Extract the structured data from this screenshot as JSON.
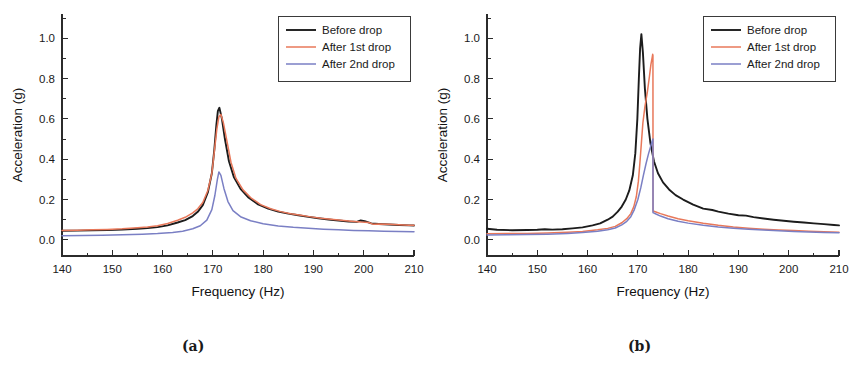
{
  "figure": {
    "panels": [
      {
        "id": "a",
        "caption": "(a)"
      },
      {
        "id": "b",
        "caption": "(b)"
      }
    ]
  },
  "colors": {
    "before_drop": "#1c1c1c",
    "after_1st_drop": "#e8785a",
    "after_2nd_drop": "#7a7fc4",
    "axis": "#2b2b2b",
    "background": "#ffffff"
  },
  "chart_data": [
    {
      "type": "line",
      "panel": "a",
      "title": "",
      "xlabel": "Frequency (Hz)",
      "ylabel": "Acceleration (g)",
      "xlim": [
        140,
        210
      ],
      "ylim": [
        -0.08,
        1.12
      ],
      "xticks": [
        140,
        150,
        160,
        170,
        180,
        190,
        200,
        210
      ],
      "yticks": [
        0.0,
        0.2,
        0.4,
        0.6,
        0.8,
        1.0
      ],
      "xtick_labels": [
        "140",
        "150",
        "160",
        "170",
        "180",
        "190",
        "200",
        "210"
      ],
      "ytick_labels": [
        "0.0",
        "0.2",
        "0.4",
        "0.6",
        "0.8",
        "1.0"
      ],
      "minor_ticks_per_interval": 1,
      "grid": false,
      "legend_position": "top-right",
      "series": [
        {
          "name": "Before drop",
          "color_key": "before_drop",
          "width": 1.9,
          "x": [
            140,
            143,
            146,
            149,
            152,
            155,
            157,
            159,
            161,
            163,
            164.5,
            166,
            167,
            168,
            169,
            169.8,
            170.3,
            170.7,
            171,
            171.3,
            171.8,
            172.4,
            173.2,
            174.2,
            175.5,
            177,
            179,
            181,
            183,
            185,
            187,
            189,
            191,
            193,
            195,
            197,
            198.6,
            199.4,
            200.2,
            201.5,
            203,
            205,
            207,
            209,
            210
          ],
          "y": [
            0.045,
            0.046,
            0.047,
            0.049,
            0.051,
            0.055,
            0.058,
            0.063,
            0.072,
            0.086,
            0.098,
            0.118,
            0.139,
            0.172,
            0.235,
            0.33,
            0.45,
            0.57,
            0.64,
            0.655,
            0.6,
            0.5,
            0.39,
            0.31,
            0.253,
            0.212,
            0.176,
            0.155,
            0.14,
            0.13,
            0.122,
            0.114,
            0.107,
            0.101,
            0.096,
            0.091,
            0.089,
            0.096,
            0.093,
            0.082,
            0.079,
            0.076,
            0.074,
            0.072,
            0.071
          ]
        },
        {
          "name": "After 1st drop",
          "color_key": "after_1st_drop",
          "width": 1.5,
          "x": [
            140,
            143,
            146,
            149,
            152,
            155,
            157,
            159,
            161,
            163,
            164.5,
            166,
            167,
            168,
            169,
            169.8,
            170.3,
            170.8,
            171.2,
            171.6,
            172.1,
            172.8,
            173.6,
            174.6,
            176,
            177.5,
            179.5,
            181.5,
            183.5,
            185.5,
            187.5,
            189.5,
            191.5,
            193.5,
            195.5,
            197.5,
            199.5,
            201,
            201.8,
            203,
            205,
            207,
            209,
            210
          ],
          "y": [
            0.047,
            0.048,
            0.05,
            0.052,
            0.055,
            0.06,
            0.064,
            0.07,
            0.081,
            0.097,
            0.112,
            0.134,
            0.154,
            0.185,
            0.245,
            0.33,
            0.44,
            0.55,
            0.61,
            0.622,
            0.58,
            0.49,
            0.385,
            0.305,
            0.248,
            0.21,
            0.175,
            0.154,
            0.14,
            0.13,
            0.122,
            0.114,
            0.107,
            0.102,
            0.097,
            0.092,
            0.088,
            0.086,
            0.078,
            0.079,
            0.077,
            0.075,
            0.073,
            0.072
          ]
        },
        {
          "name": "After 2nd drop",
          "color_key": "after_2nd_drop",
          "width": 1.5,
          "x": [
            140,
            144,
            148,
            152,
            156,
            159,
            162,
            164,
            166,
            167.5,
            168.8,
            169.8,
            170.4,
            170.9,
            171.2,
            171.6,
            172.2,
            173,
            174,
            175.5,
            177.5,
            180,
            183,
            186,
            189,
            192,
            195,
            198,
            201,
            204,
            207,
            210
          ],
          "y": [
            0.021,
            0.022,
            0.023,
            0.025,
            0.028,
            0.031,
            0.037,
            0.043,
            0.055,
            0.07,
            0.098,
            0.15,
            0.22,
            0.3,
            0.337,
            0.32,
            0.255,
            0.19,
            0.145,
            0.115,
            0.095,
            0.08,
            0.069,
            0.062,
            0.057,
            0.053,
            0.05,
            0.047,
            0.045,
            0.043,
            0.041,
            0.04
          ]
        }
      ]
    },
    {
      "type": "line",
      "panel": "b",
      "title": "",
      "xlabel": "Frequency (Hz)",
      "ylabel": "Acceleration (g)",
      "xlim": [
        140,
        210
      ],
      "ylim": [
        -0.08,
        1.12
      ],
      "xticks": [
        140,
        150,
        160,
        170,
        180,
        190,
        200,
        210
      ],
      "yticks": [
        0.0,
        0.2,
        0.4,
        0.6,
        0.8,
        1.0
      ],
      "xtick_labels": [
        "140",
        "150",
        "160",
        "170",
        "180",
        "190",
        "200",
        "210"
      ],
      "ytick_labels": [
        "0.0",
        "0.2",
        "0.4",
        "0.6",
        "0.8",
        "1.0"
      ],
      "minor_ticks_per_interval": 1,
      "grid": false,
      "legend_position": "top-right",
      "series": [
        {
          "name": "Before drop",
          "color_key": "before_drop",
          "width": 1.9,
          "x": [
            140,
            142,
            145,
            148,
            150,
            151.5,
            153,
            155,
            157,
            159,
            161,
            162.5,
            164,
            165,
            166,
            166.8,
            167.6,
            168.3,
            169,
            169.5,
            169.9,
            170.2,
            170.45,
            170.7,
            171,
            171.4,
            171.9,
            172.5,
            173.2,
            174,
            175,
            176.2,
            177.5,
            179,
            181,
            183,
            184.8,
            186,
            188,
            190,
            191.5,
            193,
            195,
            197,
            199,
            201,
            203,
            205,
            207,
            209,
            210
          ],
          "y": [
            0.055,
            0.05,
            0.048,
            0.049,
            0.05,
            0.053,
            0.051,
            0.053,
            0.057,
            0.062,
            0.072,
            0.082,
            0.1,
            0.115,
            0.14,
            0.165,
            0.2,
            0.245,
            0.32,
            0.43,
            0.6,
            0.8,
            0.95,
            1.02,
            0.93,
            0.75,
            0.6,
            0.48,
            0.39,
            0.33,
            0.285,
            0.25,
            0.222,
            0.2,
            0.175,
            0.155,
            0.148,
            0.14,
            0.13,
            0.122,
            0.12,
            0.113,
            0.106,
            0.1,
            0.095,
            0.09,
            0.086,
            0.082,
            0.078,
            0.074,
            0.072
          ]
        },
        {
          "name": "After 1st drop",
          "color_key": "after_1st_drop",
          "width": 1.5,
          "x": [
            140,
            144,
            148,
            152,
            156,
            159,
            162,
            164,
            165.5,
            166.8,
            167.8,
            168.6,
            169.2,
            169.7,
            170.1,
            170.4,
            170.7,
            171,
            171.4,
            171.9,
            172.3,
            172.6,
            172.85,
            172.95,
            173.0,
            173.02,
            173.6,
            174.5,
            176,
            178,
            180,
            183,
            186,
            189,
            192,
            195,
            198,
            201,
            204,
            207,
            210
          ],
          "y": [
            0.03,
            0.031,
            0.032,
            0.034,
            0.038,
            0.042,
            0.05,
            0.057,
            0.067,
            0.085,
            0.105,
            0.13,
            0.165,
            0.215,
            0.29,
            0.38,
            0.48,
            0.58,
            0.66,
            0.735,
            0.81,
            0.87,
            0.905,
            0.92,
            0.915,
            0.143,
            0.138,
            0.13,
            0.118,
            0.105,
            0.095,
            0.082,
            0.072,
            0.064,
            0.058,
            0.053,
            0.049,
            0.046,
            0.043,
            0.04,
            0.038
          ]
        },
        {
          "name": "After 2nd drop",
          "color_key": "after_2nd_drop",
          "width": 1.5,
          "x": [
            140,
            144,
            148,
            152,
            156,
            159,
            162,
            164,
            165.5,
            166.8,
            167.8,
            168.6,
            169.3,
            170,
            170.6,
            171.1,
            171.6,
            172.1,
            172.5,
            172.8,
            172.95,
            173.0,
            173.02,
            173.6,
            174.5,
            176,
            178,
            180,
            183,
            186,
            189,
            192,
            195,
            198,
            201,
            204,
            207,
            210
          ],
          "y": [
            0.024,
            0.025,
            0.026,
            0.028,
            0.032,
            0.036,
            0.043,
            0.05,
            0.059,
            0.074,
            0.092,
            0.115,
            0.15,
            0.2,
            0.26,
            0.32,
            0.375,
            0.425,
            0.46,
            0.485,
            0.497,
            0.5,
            0.135,
            0.128,
            0.118,
            0.105,
            0.092,
            0.083,
            0.072,
            0.064,
            0.058,
            0.053,
            0.049,
            0.045,
            0.042,
            0.039,
            0.037,
            0.035
          ]
        }
      ]
    }
  ]
}
